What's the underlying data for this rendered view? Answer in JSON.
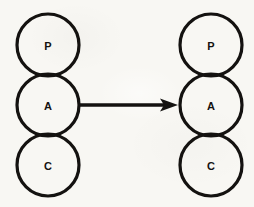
{
  "figure": {
    "background_color": "#f8f7f3",
    "ink_color": "#141210",
    "width": 254,
    "height": 207
  },
  "groups": [
    {
      "id": "left-agent",
      "name": "left-pac-agent",
      "center_x": 48,
      "nodes": [
        {
          "id": "left-presentation",
          "label": "P",
          "cx": 48,
          "cy": 45,
          "r": 31
        },
        {
          "id": "left-abstraction",
          "label": "A",
          "cx": 48,
          "cy": 105,
          "r": 31
        },
        {
          "id": "left-control",
          "label": "C",
          "cx": 48,
          "cy": 165,
          "r": 31
        }
      ]
    },
    {
      "id": "right-agent",
      "name": "right-pac-agent",
      "center_x": 211,
      "nodes": [
        {
          "id": "right-presentation",
          "label": "P",
          "cx": 211,
          "cy": 45,
          "r": 31
        },
        {
          "id": "right-abstraction",
          "label": "A",
          "cx": 211,
          "cy": 105,
          "r": 31
        },
        {
          "id": "right-control",
          "label": "C",
          "cx": 211,
          "cy": 165,
          "r": 31
        }
      ]
    }
  ],
  "connector": {
    "id": "abstraction-link",
    "name": "abstraction-arrow",
    "kind": "single-headed-arrow",
    "from": "left-abstraction",
    "to": "right-abstraction",
    "x_start": 80,
    "x_end": 178,
    "y": 105,
    "label": ""
  },
  "labels": {
    "presentation": "P",
    "abstraction": "A",
    "control": "C"
  }
}
